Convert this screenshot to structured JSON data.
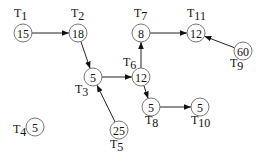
{
  "diagram": {
    "type": "task-precedence-graph",
    "nodes": [
      {
        "id": "T1",
        "label": "T",
        "sub": "1",
        "value": "15",
        "x": 23,
        "y": 33,
        "lx": 14,
        "ly": 17
      },
      {
        "id": "T2",
        "label": "T",
        "sub": "2",
        "value": "18",
        "x": 78,
        "y": 33,
        "lx": 71,
        "ly": 17
      },
      {
        "id": "T3",
        "label": "T",
        "sub": "3",
        "value": "5",
        "x": 93,
        "y": 77,
        "lx": 75,
        "ly": 93
      },
      {
        "id": "T4",
        "label": "T",
        "sub": "4",
        "value": "5",
        "x": 35,
        "y": 127,
        "lx": 13,
        "ly": 133
      },
      {
        "id": "T5",
        "label": "T",
        "sub": "5",
        "value": "25",
        "x": 119,
        "y": 130,
        "lx": 110,
        "ly": 148
      },
      {
        "id": "T6",
        "label": "T",
        "sub": "6",
        "value": "12",
        "x": 141,
        "y": 77,
        "lx": 123,
        "ly": 66
      },
      {
        "id": "T7",
        "label": "T",
        "sub": "7",
        "value": "8",
        "x": 141,
        "y": 33,
        "lx": 134,
        "ly": 17
      },
      {
        "id": "T8",
        "label": "T",
        "sub": "8",
        "value": "5",
        "x": 151,
        "y": 107,
        "lx": 145,
        "ly": 124
      },
      {
        "id": "T9",
        "label": "T",
        "sub": "9",
        "value": "60",
        "x": 243,
        "y": 51,
        "lx": 230,
        "ly": 67
      },
      {
        "id": "T10",
        "label": "T",
        "sub": "10",
        "value": "5",
        "x": 200,
        "y": 107,
        "lx": 191,
        "ly": 124
      },
      {
        "id": "T11",
        "label": "T",
        "sub": "11",
        "value": "12",
        "x": 196,
        "y": 33,
        "lx": 187,
        "ly": 17
      }
    ],
    "edges": [
      {
        "from": "T1",
        "to": "T2"
      },
      {
        "from": "T2",
        "to": "T3"
      },
      {
        "from": "T3",
        "to": "T6"
      },
      {
        "from": "T5",
        "to": "T3"
      },
      {
        "from": "T6",
        "to": "T7"
      },
      {
        "from": "T6",
        "to": "T8"
      },
      {
        "from": "T7",
        "to": "T11"
      },
      {
        "from": "T8",
        "to": "T10"
      },
      {
        "from": "T9",
        "to": "T11"
      }
    ]
  }
}
